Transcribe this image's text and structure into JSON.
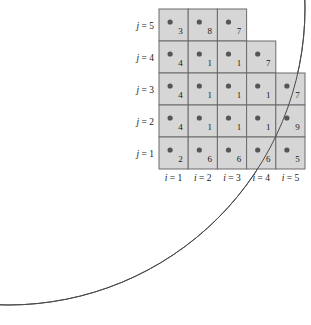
{
  "figure": {
    "title": "",
    "circle": {
      "center_x": 8,
      "center_y": 8,
      "radius": 297,
      "stroke": "#4a4a4a"
    },
    "colors": {
      "cell_fill": "#d6d6d6",
      "cell_stroke": "#6b6b6b",
      "dot": "#555555",
      "text": "#1a1a1a",
      "arc": "#4a4a4a",
      "background": "#ffffff"
    },
    "grid": {
      "origin_x": 159,
      "origin_y": 9,
      "cell_w": 29.2,
      "cell_h": 32,
      "rows": 5,
      "cols": 5
    },
    "row_labels": [
      {
        "name": "j = 5",
        "var": "j",
        "value": 5
      },
      {
        "name": "j = 4",
        "var": "j",
        "value": 4
      },
      {
        "name": "j = 3",
        "var": "j",
        "value": 3
      },
      {
        "name": "j = 2",
        "var": "j",
        "value": 2
      },
      {
        "name": "j = 1",
        "var": "j",
        "value": 1
      }
    ],
    "col_labels": [
      {
        "name": "i = 1",
        "var": "i",
        "value": 1
      },
      {
        "name": "i = 2",
        "var": "i",
        "value": 2
      },
      {
        "name": "i = 3",
        "var": "i",
        "value": 3
      },
      {
        "name": "i = 4",
        "var": "i",
        "value": 4
      },
      {
        "name": "i = 5",
        "var": "i",
        "value": 5
      }
    ],
    "cells": [
      {
        "j": 5,
        "values": [
          3,
          8,
          7
        ]
      },
      {
        "j": 4,
        "values": [
          4,
          1,
          1,
          7
        ]
      },
      {
        "j": 3,
        "values": [
          4,
          1,
          1,
          1,
          7
        ]
      },
      {
        "j": 2,
        "values": [
          4,
          1,
          1,
          1,
          9
        ]
      },
      {
        "j": 1,
        "values": [
          2,
          6,
          6,
          6,
          5
        ]
      }
    ]
  },
  "chart_data": {
    "type": "heatmap",
    "title": "",
    "xlabel": "i",
    "ylabel": "j",
    "x": [
      1,
      2,
      3,
      4,
      5
    ],
    "y": [
      1,
      2,
      3,
      4,
      5
    ],
    "categories": [
      "i = 1",
      "i = 2",
      "i = 3",
      "i = 4",
      "i = 5"
    ],
    "row_categories": [
      "j = 1",
      "j = 2",
      "j = 3",
      "j = 4",
      "j = 5"
    ],
    "series": [
      {
        "name": "j = 5",
        "values": [
          3,
          8,
          7,
          null,
          null
        ]
      },
      {
        "name": "j = 4",
        "values": [
          4,
          1,
          1,
          7,
          null
        ]
      },
      {
        "name": "j = 3",
        "values": [
          4,
          1,
          1,
          1,
          7
        ]
      },
      {
        "name": "j = 2",
        "values": [
          4,
          1,
          1,
          1,
          9
        ]
      },
      {
        "name": "j = 1",
        "values": [
          2,
          6,
          6,
          6,
          5
        ]
      }
    ],
    "annotations": [
      {
        "text": "quarter circle arc passing through the cell grid"
      }
    ],
    "grid": true,
    "legend": "none"
  }
}
